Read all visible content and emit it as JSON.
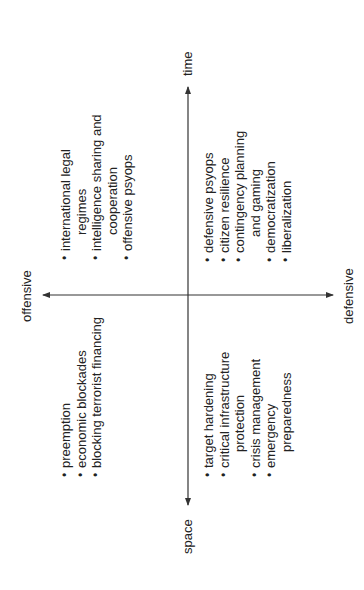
{
  "figure": {
    "axes": {
      "horizontal": {
        "left_label": "space",
        "right_label": "time"
      },
      "vertical": {
        "top_label": "offensive",
        "bottom_label": "defensive"
      }
    },
    "quadrants": {
      "offensive_space": {
        "items": [
          [
            "preemption"
          ],
          [
            "economic blockades"
          ],
          [
            "blocking terrorist financing"
          ]
        ]
      },
      "offensive_time": {
        "items": [
          [
            "international legal",
            "regimes"
          ],
          [
            "intelligence sharing and",
            "cooperation"
          ],
          [
            "offensive psyops"
          ]
        ]
      },
      "defensive_space": {
        "items": [
          [
            "target hardening"
          ],
          [
            "critical infrastructure",
            "protection"
          ],
          [
            "crisis management"
          ],
          [
            "emergency",
            "preparedness"
          ]
        ]
      },
      "defensive_time": {
        "items": [
          [
            "defensive psyops"
          ],
          [
            "citizen resilience"
          ],
          [
            "contingency planning",
            "and gaming"
          ],
          [
            "democratization"
          ],
          [
            "liberalization"
          ]
        ]
      }
    },
    "orientation": "rotated 90 degrees counterclockwise",
    "colors": {
      "line": "#333333",
      "text": "#222222",
      "background": "#ffffff"
    }
  }
}
